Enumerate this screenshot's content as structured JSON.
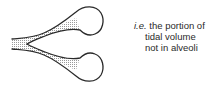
{
  "diagram": {
    "caption": {
      "abbrev": "i.e.",
      "line1": "the portion of",
      "line2": "tidal volume",
      "line3": "not in alveoli"
    },
    "colors": {
      "outline": "#2a2a2a",
      "stipple": "#9a9a9a",
      "background": "#ffffff"
    }
  }
}
